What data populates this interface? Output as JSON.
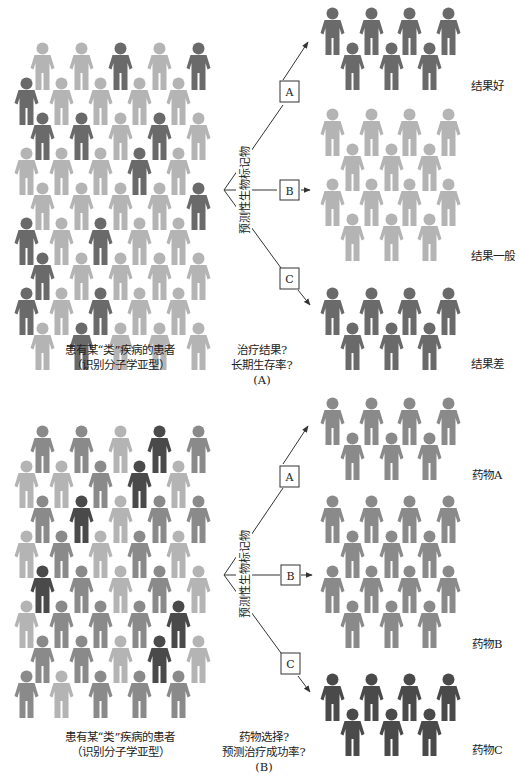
{
  "colors": {
    "light": "#b4b4b4",
    "mid": "#8a8a8a",
    "dark": "#6a6a6a",
    "darker": "#4a4a4a",
    "line": "#333333",
    "background": "#ffffff"
  },
  "panel_a": {
    "caption_line1": "患有某“类”疾病的患者",
    "caption_line2": "（识别分子学亚型）",
    "question_line1": "治疗结果?",
    "question_line2": "长期生存率?",
    "panel_label": "(A)",
    "biomarker_label": "预测性生物标记物",
    "branches": [
      {
        "box": "A",
        "outcome": "结果好",
        "group_color": "dark"
      },
      {
        "box": "B",
        "outcome": "结果一般",
        "group_color": "light"
      },
      {
        "box": "C",
        "outcome": "结果差",
        "group_color": "dark"
      }
    ]
  },
  "panel_b": {
    "caption_line1": "患有某“类”疾病的患者",
    "caption_line2": "（识别分子学亚型）",
    "question_line1": "药物选择?",
    "question_line2": "预测治疗成功率?",
    "panel_label": "(B)",
    "biomarker_label": "预测性生物标记物",
    "branches": [
      {
        "box": "A",
        "outcome": "药物A",
        "group_color": "mid"
      },
      {
        "box": "B",
        "outcome": "药物B",
        "group_color": "mid"
      },
      {
        "box": "C",
        "outcome": "药物C",
        "group_color": "darker"
      }
    ]
  }
}
